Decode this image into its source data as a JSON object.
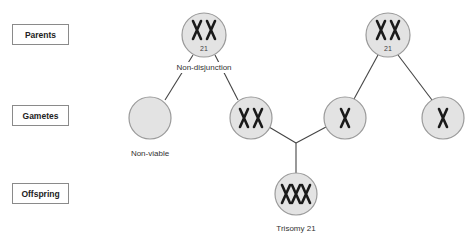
{
  "row_labels": {
    "parents": "Parents",
    "gametes": "Gametes",
    "offspring": "Offspring"
  },
  "parents": [
    {
      "id": "parent-1",
      "chromosome_count": 2,
      "chromosome_number": "21",
      "annotation": "Non-disjunction"
    },
    {
      "id": "parent-2",
      "chromosome_count": 2,
      "chromosome_number": "21"
    }
  ],
  "gametes": [
    {
      "id": "gamete-empty",
      "chromosome_count": 0,
      "caption": "Non-viable"
    },
    {
      "id": "gamete-disomic",
      "chromosome_count": 2
    },
    {
      "id": "gamete-normal-a",
      "chromosome_count": 1
    },
    {
      "id": "gamete-normal-b",
      "chromosome_count": 1
    }
  ],
  "offspring": {
    "id": "offspring-trisomy",
    "chromosome_count": 3,
    "caption": "Trisomy 21"
  },
  "colors": {
    "circle_fill": "#e3e3e3",
    "circle_stroke": "#9a9a9a",
    "line": "#444444",
    "chromosome": "#1a1a1a"
  }
}
